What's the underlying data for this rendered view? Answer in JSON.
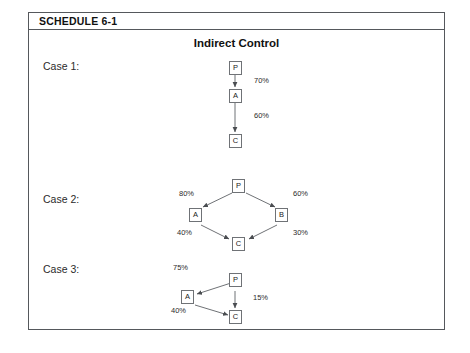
{
  "schedule": {
    "label": "SCHEDULE 6-1",
    "title": "Indirect Control"
  },
  "cases": [
    {
      "label": "Case 1:",
      "nodes": [
        {
          "id": "P",
          "label": "P"
        },
        {
          "id": "A",
          "label": "A"
        },
        {
          "id": "C",
          "label": "C"
        }
      ],
      "edges": [
        {
          "from": "P",
          "to": "A",
          "percent": "70%"
        },
        {
          "from": "A",
          "to": "C",
          "percent": "60%"
        }
      ]
    },
    {
      "label": "Case 2:",
      "nodes": [
        {
          "id": "P",
          "label": "P"
        },
        {
          "id": "A",
          "label": "A"
        },
        {
          "id": "B",
          "label": "B"
        },
        {
          "id": "C",
          "label": "C"
        }
      ],
      "edges": [
        {
          "from": "P",
          "to": "A",
          "percent": "80%"
        },
        {
          "from": "P",
          "to": "B",
          "percent": "60%"
        },
        {
          "from": "A",
          "to": "C",
          "percent": "40%"
        },
        {
          "from": "B",
          "to": "C",
          "percent": "30%"
        }
      ]
    },
    {
      "label": "Case 3:",
      "nodes": [
        {
          "id": "P",
          "label": "P"
        },
        {
          "id": "A",
          "label": "A"
        },
        {
          "id": "C",
          "label": "C"
        }
      ],
      "edges": [
        {
          "from": "P",
          "to": "A",
          "percent": "75%"
        },
        {
          "from": "P",
          "to": "C",
          "percent": "15%"
        },
        {
          "from": "A",
          "to": "C",
          "percent": "40%"
        }
      ]
    }
  ],
  "colors": {
    "frame_border": "#55585c",
    "node_border": "#6f7276",
    "text": "#1a1a1a",
    "background": "#ffffff"
  }
}
